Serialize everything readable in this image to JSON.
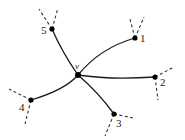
{
  "diagram": {
    "type": "graph",
    "center": {
      "id": "v",
      "label": "v"
    },
    "nodes": [
      {
        "id": "1",
        "label": "1"
      },
      {
        "id": "2",
        "label": "2"
      },
      {
        "id": "3",
        "label": "3"
      },
      {
        "id": "4",
        "label": "4"
      },
      {
        "id": "5",
        "label": "5"
      }
    ],
    "edges": [
      {
        "from": "v",
        "to": "1",
        "style": "solid"
      },
      {
        "from": "v",
        "to": "2",
        "style": "solid"
      },
      {
        "from": "v",
        "to": "3",
        "style": "solid"
      },
      {
        "from": "v",
        "to": "4",
        "style": "solid"
      },
      {
        "from": "v",
        "to": "5",
        "style": "solid"
      }
    ],
    "dashed_stubs_per_node": 2,
    "colors": {
      "line": "#1a1a1a",
      "node": "#000000",
      "background": "#ffffff"
    }
  }
}
